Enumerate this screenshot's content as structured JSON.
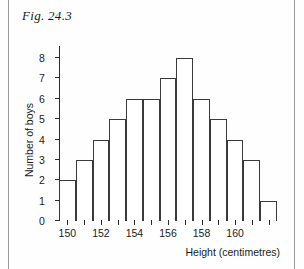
{
  "figure": {
    "caption": "Fig. 24.3"
  },
  "chart_data": {
    "type": "bar",
    "title": "Fig. 24.3",
    "xlabel": "Height (centimetres)",
    "ylabel": "Number of boys",
    "categories": [
      150,
      151,
      152,
      153,
      154,
      155,
      156,
      157,
      158,
      159,
      160,
      161,
      162
    ],
    "values": [
      2,
      3,
      4,
      5,
      6,
      6,
      7,
      8,
      6,
      5,
      4,
      3,
      1
    ],
    "bar_left_edges": [
      149.5,
      150.5,
      151.5,
      152.5,
      153.5,
      154.5,
      155.5,
      156.5,
      157.5,
      158.5,
      159.5,
      160.5,
      161.5
    ],
    "bar_width": 1,
    "xlim": [
      149.5,
      162.5
    ],
    "ylim": [
      0,
      8
    ],
    "x_major_ticks": [
      150,
      152,
      154,
      156,
      158,
      160
    ],
    "x_minor_ticks": [
      151,
      153,
      155,
      157,
      159,
      161,
      162
    ],
    "x_tick_labels": [
      "150",
      "152",
      "154",
      "156",
      "158",
      "160"
    ],
    "y_ticks": [
      0,
      1,
      2,
      3,
      4,
      5,
      6,
      7,
      8
    ],
    "y_tick_labels": [
      "0",
      "1",
      "2",
      "3",
      "4",
      "5",
      "6",
      "7",
      "8"
    ],
    "grid": false,
    "legend": null,
    "bar_fill": "#ffffff",
    "bar_stroke": "#3a3a3a",
    "axis_color": "#2b2b2b",
    "background": "#fefefe"
  }
}
